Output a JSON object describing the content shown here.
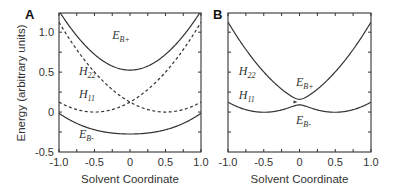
{
  "chart_data": [
    {
      "type": "line",
      "panel": "A",
      "title": "",
      "xlabel": "Solvent Coordinate",
      "ylabel": "Energy (arbitrary units)",
      "xlim": [
        -1.0,
        1.0
      ],
      "ylim": [
        -0.5,
        1.25
      ],
      "xticks": [
        "-1.0",
        "-0.5",
        "0",
        "0.5",
        "1.0"
      ],
      "yticks": [
        "-0.5",
        "0",
        "0.5",
        "1.0"
      ],
      "grid": false,
      "model": {
        "a": 0.5,
        "center": 0.5,
        "coupling": 0.4
      },
      "series": [
        {
          "name": "E_B+",
          "style": "solid",
          "x": [
            -1.0,
            -0.5,
            0,
            0.5,
            1.0
          ],
          "y": [
            1.22,
            0.83,
            0.52,
            0.83,
            1.22
          ]
        },
        {
          "name": "H_22",
          "style": "dashed",
          "x": [
            -1.0,
            -0.5,
            0,
            0.5,
            1.0
          ],
          "y": [
            0.125,
            0,
            0.125,
            0.5,
            1.125
          ]
        },
        {
          "name": "H_11",
          "style": "dashed",
          "x": [
            -1.0,
            -0.5,
            0,
            0.5,
            1.0
          ],
          "y": [
            1.125,
            0.5,
            0.125,
            0,
            0.125
          ]
        },
        {
          "name": "E_B-",
          "style": "solid",
          "x": [
            -1.0,
            -0.5,
            0,
            0.5,
            1.0
          ],
          "y": [
            0.03,
            -0.2,
            -0.27,
            -0.2,
            0.03
          ]
        }
      ],
      "labels": [
        {
          "text": "E",
          "sub": "B+",
          "x": -0.25,
          "y": 0.92
        },
        {
          "text": "H",
          "sub": "22",
          "x": -0.72,
          "y": 0.46
        },
        {
          "text": "H",
          "sub": "11",
          "x": -0.72,
          "y": 0.18
        },
        {
          "text": "E",
          "sub": "B-",
          "x": -0.72,
          "y": -0.32
        }
      ]
    },
    {
      "type": "line",
      "panel": "B",
      "title": "",
      "xlabel": "Solvent Coordinate",
      "ylabel": "",
      "xlim": [
        -1.0,
        1.0
      ],
      "ylim": [
        -0.5,
        1.25
      ],
      "xticks": [
        "-1.0",
        "-0.5",
        "0",
        "0.5",
        "1.0"
      ],
      "yticks": [],
      "grid": false,
      "model": {
        "a": 0.5,
        "center": 0.5,
        "coupling": 0.035
      },
      "series": [
        {
          "name": "E_B+",
          "style": "solid",
          "x": [
            -1.0,
            -0.5,
            0,
            0.5,
            1.0
          ],
          "y": [
            1.125,
            0.5,
            0.16,
            0.5,
            1.125
          ]
        },
        {
          "name": "E_B-",
          "style": "solid",
          "x": [
            -1.0,
            -0.5,
            0,
            0.5,
            1.0
          ],
          "y": [
            0.125,
            0,
            0.09,
            0,
            0.125
          ]
        }
      ],
      "labels": [
        {
          "text": "H",
          "sub": "22",
          "x": -0.85,
          "y": 0.46
        },
        {
          "text": "E",
          "sub": "B+",
          "x": -0.05,
          "y": 0.32
        },
        {
          "text": "H",
          "sub": "11",
          "x": -0.85,
          "y": 0.16
        },
        {
          "text": "E",
          "sub": "B-",
          "x": -0.05,
          "y": -0.15
        }
      ]
    }
  ],
  "panels": [
    {
      "letter": "A",
      "xlabel": "Solvent Coordinate",
      "ylabel": "Energy (arbitrary units)"
    },
    {
      "letter": "B",
      "xlabel": "Solvent Coordinate"
    }
  ],
  "axis": {
    "xtick_labels": [
      "-1.0",
      "-0.5",
      "0",
      "0.5",
      "1.0"
    ],
    "ytick_labels": [
      "1.0",
      "0.5",
      "0",
      "-0.5"
    ]
  }
}
